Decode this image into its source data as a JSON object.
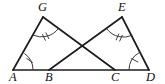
{
  "figure": {
    "background_color": "#ffffff",
    "line_color": "#1c1c1c",
    "mark_color": "#3a3a3a",
    "width": 165,
    "height": 84,
    "points": {
      "A": {
        "label": "A",
        "x": 13,
        "y": 70,
        "label_x": 9,
        "label_y": 81
      },
      "B": {
        "label": "B",
        "x": 49,
        "y": 70,
        "label_x": 45,
        "label_y": 81
      },
      "C": {
        "label": "C",
        "x": 115,
        "y": 70,
        "label_x": 111,
        "label_y": 81
      },
      "D": {
        "label": "D",
        "x": 149,
        "y": 70,
        "label_x": 146,
        "label_y": 81
      },
      "G": {
        "label": "G",
        "x": 43,
        "y": 17,
        "label_x": 38,
        "label_y": 11
      },
      "E": {
        "label": "E",
        "x": 122,
        "y": 17,
        "label_x": 118,
        "label_y": 11
      }
    },
    "segments": [
      {
        "name": "baseline-AD",
        "from": "A",
        "to": "D"
      },
      {
        "name": "side-AG",
        "from": "A",
        "to": "G"
      },
      {
        "name": "side-GC",
        "from": "G",
        "to": "C"
      },
      {
        "name": "side-BE",
        "from": "B",
        "to": "E"
      },
      {
        "name": "side-ED",
        "from": "E",
        "to": "D"
      }
    ],
    "intersection": {
      "name": "crossing-point",
      "x": 82,
      "y": 46
    },
    "angle_marks": [
      {
        "vertex": "A",
        "ticks": 1,
        "name": "angle-mark-a"
      },
      {
        "vertex": "D",
        "ticks": 1,
        "name": "angle-mark-d"
      },
      {
        "vertex": "G",
        "ticks": 2,
        "name": "angle-mark-g"
      },
      {
        "vertex": "E",
        "ticks": 2,
        "name": "angle-mark-e"
      }
    ]
  }
}
